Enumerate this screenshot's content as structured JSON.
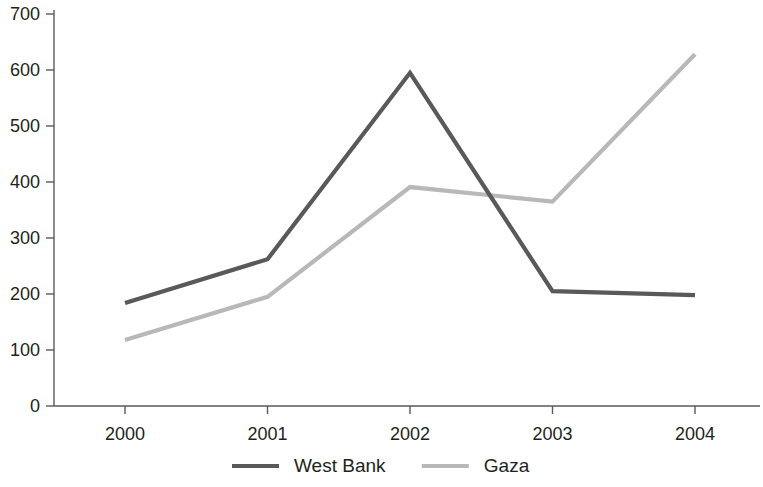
{
  "chart_data": {
    "type": "line",
    "title": "",
    "subtitle": "",
    "xlabel": "",
    "ylabel": "",
    "categories": [
      "2000",
      "2001",
      "2002",
      "2003",
      "2004"
    ],
    "series": [
      {
        "name": "West Bank",
        "color": "#595959",
        "values": [
          184,
          262,
          595,
          205,
          198
        ]
      },
      {
        "name": "Gaza",
        "color": "#b8b8b8",
        "values": [
          118,
          195,
          391,
          365,
          628
        ]
      }
    ],
    "ylim": [
      0,
      700
    ],
    "ytick_labels": [
      "0",
      "100",
      "200",
      "300",
      "400",
      "500",
      "600",
      "700"
    ],
    "ytick_values": [
      0,
      100,
      200,
      300,
      400,
      500,
      600,
      700
    ],
    "grid": false,
    "legend_position": "bottom-center",
    "legend": [
      {
        "label": "West Bank",
        "color": "#595959"
      },
      {
        "label": "Gaza",
        "color": "#b8b8b8"
      }
    ],
    "axis_color": "#5a5a5a",
    "background": "#ffffff"
  }
}
